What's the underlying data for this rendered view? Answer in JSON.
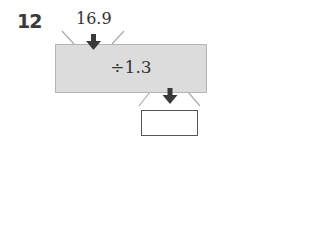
{
  "problem": {
    "number": "12",
    "input_value": "16.9",
    "operation": "÷1.3",
    "answer_box": ""
  },
  "icons": [
    "arrow-down-icon",
    "arrow-down-icon"
  ],
  "colors": {
    "machine_fill": "#dcdcdc",
    "arrow": "#3a3a3a"
  }
}
